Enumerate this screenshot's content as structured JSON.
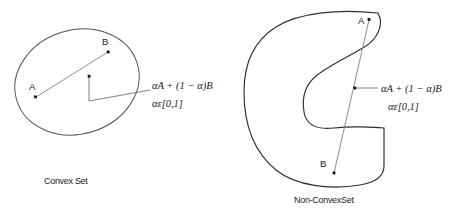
{
  "figure": {
    "background_color": "#ffffff",
    "width": 453,
    "height": 217,
    "stroke_color": "#55555a",
    "dot_color": "#141417",
    "text_color": "#1c1c20"
  },
  "panels": [
    {
      "id": "convex",
      "caption": "Convex Set",
      "shape_type": "ellipse",
      "points": [
        {
          "label": "A",
          "x": 35,
          "y": 97
        },
        {
          "label": "B",
          "x": 108,
          "y": 52
        },
        {
          "label": "",
          "x": 89,
          "y": 76
        }
      ],
      "formula_line1": "αA + (1 − α)B",
      "formula_line2": "αε[0,1]"
    },
    {
      "id": "nonconvex",
      "caption": "Non-ConvexSet",
      "shape_type": "c-shape",
      "points": [
        {
          "label": "A",
          "x": 368,
          "y": 19
        },
        {
          "label": "B",
          "x": 333,
          "y": 173
        },
        {
          "label": "",
          "x": 354,
          "y": 88
        }
      ],
      "formula_line1": "αA + (1 − α)B",
      "formula_line2": "αε[0,1]"
    }
  ]
}
